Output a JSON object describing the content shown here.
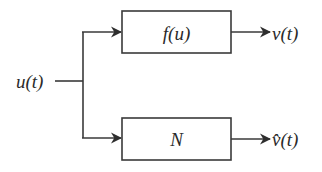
{
  "diagram": {
    "input": {
      "label": "u(t)"
    },
    "blocks": [
      {
        "id": "system",
        "label": "f(u)",
        "output": "v(t)"
      },
      {
        "id": "model",
        "label": "N",
        "output": "v̂(t)"
      }
    ],
    "colors": {
      "stroke": "#3a3a3a",
      "text": "#2a2a2a",
      "background": "#ffffff"
    }
  }
}
